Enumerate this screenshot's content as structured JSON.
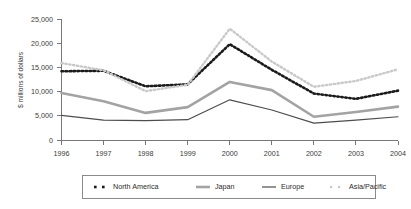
{
  "chart_data": {
    "type": "line",
    "title": "",
    "subtitle": "",
    "xlabel": "",
    "ylabel": "$ millions of dollars",
    "categories": [
      "1996",
      "1997",
      "1998",
      "1999",
      "2000",
      "2001",
      "2002",
      "2003",
      "2004"
    ],
    "x": [
      1996,
      1997,
      1998,
      1999,
      2000,
      2001,
      2002,
      2003,
      2004
    ],
    "ylim": [
      0,
      25000
    ],
    "xlim": [
      1996,
      2004
    ],
    "yticks": [
      0,
      5000,
      10000,
      15000,
      20000,
      25000
    ],
    "ytick_labels": [
      "0",
      "5,000",
      "10,000",
      "15,000",
      "20,000",
      "25,000"
    ],
    "xtick_labels": [
      "1996",
      "1997",
      "1998",
      "1999",
      "2000",
      "2001",
      "2002",
      "2003",
      "2004"
    ],
    "grid": false,
    "legend_position": "bottom",
    "series": [
      {
        "name": "North America",
        "style": "dotted-square",
        "color": "#1a1a1a",
        "width": 2.6,
        "values": [
          14200,
          14300,
          11100,
          11500,
          19800,
          14500,
          9600,
          8500,
          10200
        ]
      },
      {
        "name": "Japan",
        "style": "solid",
        "color": "#a3a3a3",
        "width": 2.6,
        "values": [
          9700,
          8000,
          5600,
          6800,
          12000,
          10300,
          4800,
          5800,
          6900
        ]
      },
      {
        "name": "Europe",
        "style": "solid",
        "color": "#4d4d4d",
        "width": 1.2,
        "values": [
          5100,
          4100,
          4000,
          4200,
          8300,
          6200,
          3500,
          4100,
          4800
        ]
      },
      {
        "name": "Asia/Pacific",
        "style": "dotted-light",
        "color": "#c9c9c9",
        "width": 2.4,
        "values": [
          15900,
          14400,
          10100,
          11400,
          23000,
          16200,
          11000,
          12200,
          14600
        ]
      }
    ]
  },
  "legend": {
    "items": [
      {
        "label": "North America",
        "marker": "square-dash-dark"
      },
      {
        "label": "Japan",
        "marker": "line-gray-thick"
      },
      {
        "label": "Europe",
        "marker": "line-dark-thin"
      },
      {
        "label": "Asia/Pacific",
        "marker": "square-dash-light"
      }
    ]
  },
  "colors": {
    "north_america": "#1a1a1a",
    "japan": "#a3a3a3",
    "europe": "#4d4d4d",
    "asia_pacific": "#c9c9c9",
    "axis": "#777777",
    "background": "#ffffff"
  }
}
